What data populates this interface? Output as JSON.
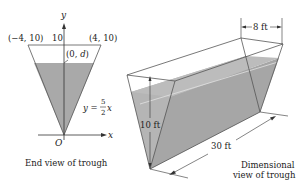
{
  "end_view": {
    "caption": "End view of trough",
    "axis_y_label": "y",
    "axis_x_label": "x",
    "origin_label": "O",
    "point_left": "(−4, 10)",
    "point_right": "(4, 10)",
    "tick_10": "10",
    "point_d": "(0, d)",
    "equation_lhs": "y =",
    "equation_num": "5",
    "equation_den": "2",
    "equation_var": "x"
  },
  "dimensional_view": {
    "caption_line1": "Dimensional",
    "caption_line2": "view of trough",
    "width_label": "8 ft",
    "height_label": "10 ft",
    "length_label": "30 ft"
  },
  "colors": {
    "water": "#a9a9a9",
    "water_light": "#bdbdbd",
    "line": "#444444",
    "background": "#ffffff"
  }
}
